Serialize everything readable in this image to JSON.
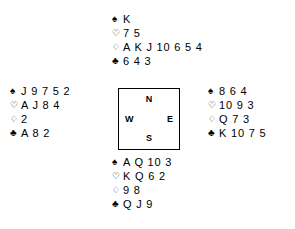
{
  "diagram": {
    "type": "bridge-deal",
    "suit_symbols": {
      "spade": "♠",
      "heart": "♡",
      "diamond": "♢",
      "club": "♣"
    },
    "compass": {
      "north": "N",
      "south": "S",
      "west": "W",
      "east": "E"
    },
    "hands": {
      "north": {
        "spades": "K",
        "hearts": "7 5",
        "diamonds": "A K J 10 6 5 4",
        "clubs": "6 4 3"
      },
      "west": {
        "spades": "J 9 7 5 2",
        "hearts": "A J 8 4",
        "diamonds": "2",
        "clubs": "A 8 2"
      },
      "east": {
        "spades": "8 6 4",
        "hearts": "10 9 3",
        "diamonds": "Q 7 3",
        "clubs": "K 10 7 5"
      },
      "south": {
        "spades": "A Q 10 3",
        "hearts": "K Q 6 2",
        "diamonds": "9 8",
        "clubs": "Q J 9"
      }
    }
  }
}
